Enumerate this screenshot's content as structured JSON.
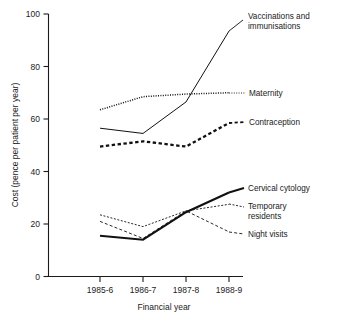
{
  "chart_data": {
    "type": "line",
    "title": "",
    "xlabel": "Financial year",
    "ylabel": "Cost (pence per patient per year)",
    "categories": [
      "1985-6",
      "1986-7",
      "1987-8",
      "1988-9"
    ],
    "xlim": [
      0,
      3
    ],
    "ylim": [
      0,
      100
    ],
    "yticks": [
      0,
      20,
      40,
      60,
      80,
      100
    ],
    "ytick_labels": [
      "0",
      "20",
      "40",
      "60",
      "80",
      "100"
    ],
    "grid": false,
    "legend_position": "right-inline-labels",
    "series": [
      {
        "name": "Vaccinations and immunisations",
        "label_lines": [
          "Vaccinations and",
          "immunisations"
        ],
        "style": "solid-thin",
        "values": [
          56.5,
          54.5,
          66.5,
          93.5
        ]
      },
      {
        "name": "Maternity",
        "label_lines": [
          "Maternity"
        ],
        "style": "dotted",
        "values": [
          63.5,
          68.5,
          69.5,
          70.0
        ]
      },
      {
        "name": "Contraception",
        "label_lines": [
          "Contraception"
        ],
        "style": "dashed-thick",
        "values": [
          49.5,
          51.5,
          49.5,
          58.5
        ]
      },
      {
        "name": "Cervical cytology",
        "label_lines": [
          "Cervical cytology"
        ],
        "style": "solid-thick",
        "values": [
          15.5,
          14.0,
          24.5,
          32.0
        ]
      },
      {
        "name": "Temporary residents",
        "label_lines": [
          "Temporary",
          "residents"
        ],
        "style": "dotted-fine",
        "values": [
          23.5,
          19.0,
          25.0,
          27.5
        ]
      },
      {
        "name": "Night visits",
        "label_lines": [
          "Night visits"
        ],
        "style": "dashed-fine",
        "values": [
          21.0,
          14.5,
          25.0,
          17.0
        ]
      }
    ]
  }
}
